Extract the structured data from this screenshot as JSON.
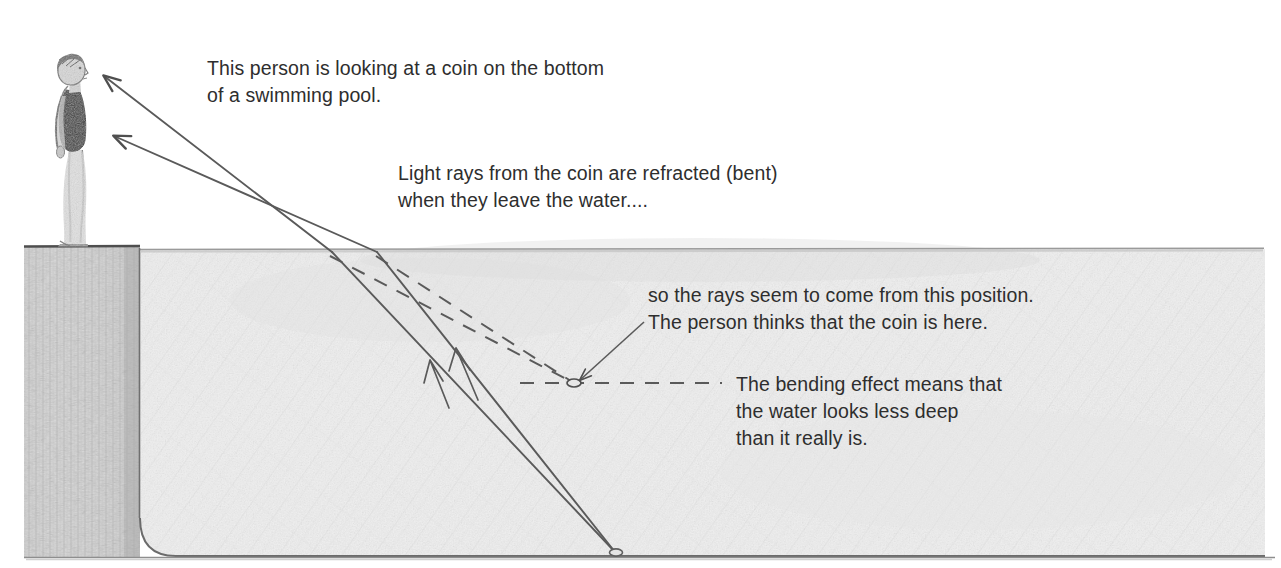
{
  "diagram": {
    "captions": {
      "intro": "This person is looking at a coin on the bottom\nof a swimming pool.",
      "refraction": "Light rays from the coin are refracted (bent)\nwhen they leave the water....",
      "virtual_image": "so the rays seem to come from this position.\nThe person thinks that the coin is here.",
      "bending_effect": "The bending effect means that\nthe water looks less deep\nthan it really is."
    },
    "labels": {
      "person": "person standing on pool edge",
      "coin": "coin on pool bottom",
      "virtual_coin": "apparent position of coin",
      "water": "swimming pool water",
      "pool_wall": "pool wall",
      "water_surface": "water surface",
      "pool_bottom": "pool bottom"
    },
    "colors": {
      "background": "#ffffff",
      "water_fill": "#efefef",
      "wall_fill": "#d8d8d8",
      "outline": "#5a5a5a",
      "ray": "#555555",
      "text": "#2e2e2e",
      "swimsuit": "#3a3a3a"
    },
    "geometry": {
      "water_surface_y": 249,
      "pool_bottom_y": 556,
      "wall_left_x": 24,
      "wall_right_x": 140,
      "water_right_x": 1265,
      "coin_point": [
        615,
        552
      ],
      "virtual_coin_point": [
        574,
        383
      ],
      "refraction_points": [
        [
          332,
          252
        ],
        [
          377,
          252
        ]
      ],
      "eye_point": [
        100,
        73
      ],
      "body_point": [
        110,
        133
      ]
    }
  }
}
